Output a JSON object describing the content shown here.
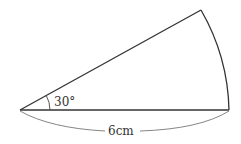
{
  "diagram": {
    "type": "sector",
    "angle_label": "30°",
    "radius_label": "6cm",
    "angle_degrees": 30,
    "radius_cm": 6,
    "colors": {
      "stroke": "#333333",
      "brace": "#777777",
      "background": "#ffffff"
    }
  }
}
